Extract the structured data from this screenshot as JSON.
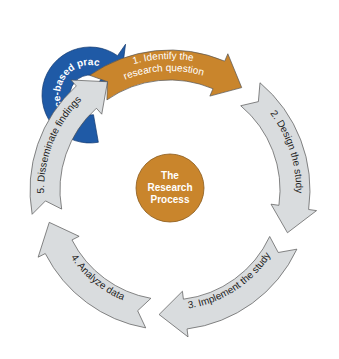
{
  "diagram": {
    "title": "The Research Process",
    "center": {
      "lines": [
        "The",
        "Research",
        "Process"
      ],
      "fill": "#c9852c",
      "text_color": "#ffffff"
    },
    "steps": [
      {
        "label": "1. Identify the research question",
        "lines": [
          "1. Identify the",
          "research question"
        ],
        "fill": "#c9852c",
        "text_color": "#ffffff"
      },
      {
        "label": "2. Design the study",
        "fill": "#d9dcde",
        "text_color": "#222222"
      },
      {
        "label": "3. Implement the study",
        "fill": "#d9dcde",
        "text_color": "#222222"
      },
      {
        "label": "4. Analyze data",
        "fill": "#d9dcde",
        "text_color": "#222222"
      },
      {
        "label": "5. Disseminate findings",
        "fill": "#d9dcde",
        "text_color": "#222222"
      }
    ],
    "feedback": {
      "label": "Evidence-based practice",
      "fill": "#1f5aa6",
      "text_color": "#ffffff"
    }
  }
}
